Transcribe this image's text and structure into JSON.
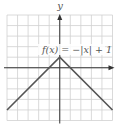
{
  "chart_data": {
    "type": "line",
    "title": "",
    "function_label": "f(x) = −|x| + 1",
    "xlabel": "",
    "ylabel": "y",
    "xlim": [
      -5,
      5
    ],
    "ylim": [
      -5,
      5
    ],
    "grid": true,
    "grid_step": 1,
    "series": [
      {
        "name": "f(x) = −|x| + 1",
        "x": [
          -5,
          0,
          5
        ],
        "y": [
          -4,
          1,
          -4
        ]
      }
    ],
    "colors": {
      "grid": "#d0d0d0",
      "axis": "#333333",
      "line": "#555555",
      "text": "#555555"
    }
  },
  "labels": {
    "y_axis": "y",
    "function": "f(x) = −|x| + 1"
  }
}
